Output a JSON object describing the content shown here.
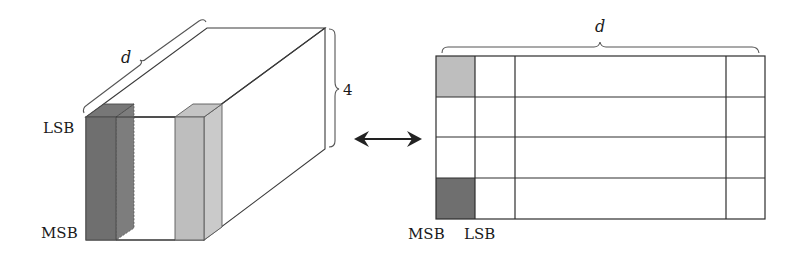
{
  "figure": {
    "left_block": {
      "description": "3D block of d columns x 4 rows (bit-planes)",
      "depth_label": "d",
      "height_label": "4",
      "top_label": "LSB",
      "bottom_label": "MSB",
      "dark_bar_color": "#6f6f6f",
      "dark_bar_side_color": "#7d7d7d",
      "light_bar_color": "#bebebe",
      "light_bar_side_color": "#cacaca"
    },
    "arrow": {
      "type": "double-headed",
      "color": "#222222"
    },
    "right_grid": {
      "width_label": "d",
      "rows": 4,
      "columns_visible": 4,
      "bottom_left_label": "MSB",
      "bottom_second_label": "LSB",
      "top_left_cell_color": "#bebebe",
      "bottom_left_cell_color": "#6f6f6f"
    }
  }
}
